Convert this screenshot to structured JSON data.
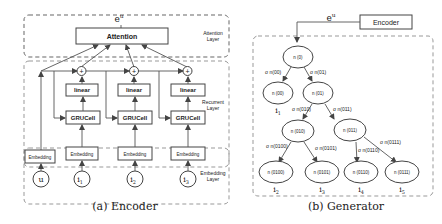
{
  "encoder": {
    "caption": "(a) Encoder",
    "output_label": "e",
    "output_sup": "u",
    "attention_label": "Attention",
    "layer_labels": {
      "attention": [
        "Attention",
        "Layer"
      ],
      "recurrent": [
        "Recurrent",
        "Layer"
      ],
      "embedding": [
        "Embedding",
        "Layer"
      ]
    },
    "plus_symbol": "+",
    "linear_label": "linear",
    "gru_label": "GRUCell",
    "embedding_label": "Embedding",
    "inputs": [
      {
        "main": "u",
        "sub": ""
      },
      {
        "main": "i",
        "sub": "1"
      },
      {
        "main": "i",
        "sub": "2"
      },
      {
        "main": "i",
        "sub": "3"
      }
    ]
  },
  "generator": {
    "caption": "(b) Generator",
    "encoder_label": "Encoder",
    "input_label": "e",
    "input_sup": "u",
    "nodes": [
      {
        "id": "n0",
        "label": "n (0)"
      },
      {
        "id": "n00",
        "label": "n (00)"
      },
      {
        "id": "n01",
        "label": "n (01)"
      },
      {
        "id": "n010",
        "label": "n (010)"
      },
      {
        "id": "n011",
        "label": "n (011)"
      },
      {
        "id": "n0100",
        "label": "n (0100)"
      },
      {
        "id": "n0101",
        "label": "n (0101)"
      },
      {
        "id": "n0110",
        "label": "n (0110)"
      },
      {
        "id": "n0111",
        "label": "n (0111)"
      }
    ],
    "edges": [
      {
        "label": "σ n(00)"
      },
      {
        "label": "σ n(01)"
      },
      {
        "label": "σ n(010)"
      },
      {
        "label": "σ n(011)"
      },
      {
        "label": "σ n(0100)"
      },
      {
        "label": "σ n(0101)"
      },
      {
        "label": "σ n(0110)"
      },
      {
        "label": "σ n(0111)"
      }
    ],
    "leaves": [
      {
        "main": "i",
        "sub": "1"
      },
      {
        "main": "i",
        "sub": "2"
      },
      {
        "main": "i",
        "sub": "3"
      },
      {
        "main": "i",
        "sub": "4"
      },
      {
        "main": "i",
        "sub": "5"
      }
    ]
  }
}
